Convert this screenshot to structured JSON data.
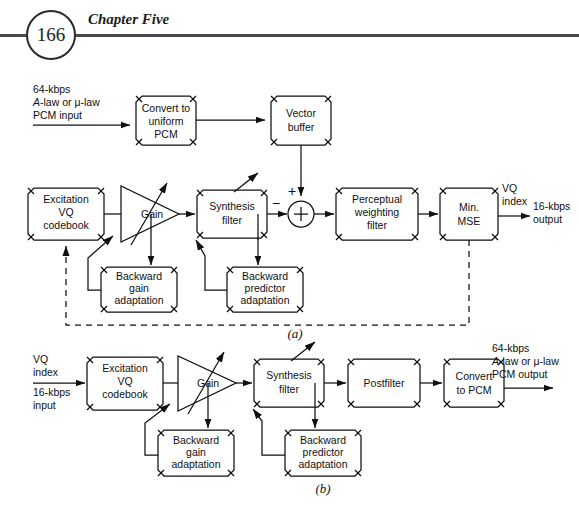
{
  "page": {
    "folio": "166",
    "chapter": "Chapter Five",
    "width": 579,
    "height": 511,
    "background": "#ffffff",
    "ink": "#101012",
    "rule_color": "#4b4b4f"
  },
  "figure": {
    "panels": [
      {
        "id": "a",
        "label": "(a)",
        "role": "encoder"
      },
      {
        "id": "b",
        "label": "(b)",
        "role": "decoder"
      }
    ]
  },
  "panel_a": {
    "label": "(a)",
    "inputs": {
      "pcm_input": {
        "line1": "64-kbps",
        "line2_italic": "A",
        "line2_rest": "-law or μ-law",
        "line3": "PCM input"
      }
    },
    "outputs": {
      "vq_index": "VQ\nindex",
      "vq_index_l1": "VQ",
      "vq_index_l2": "index",
      "bitstream_l1": "16-kbps",
      "bitstream_l2": "output"
    },
    "blocks": [
      {
        "name": "convert-to-uniform-pcm",
        "lines": [
          "Convert to",
          "uniform",
          "PCM"
        ]
      },
      {
        "name": "vector-buffer",
        "lines": [
          "Vector",
          "buffer"
        ]
      },
      {
        "name": "excitation-vq-codebook",
        "lines": [
          "Excitation",
          "VQ",
          "codebook"
        ]
      },
      {
        "name": "gain",
        "lines": [
          "Gain"
        ],
        "shape": "triangle"
      },
      {
        "name": "synthesis-filter",
        "lines": [
          "Synthesis",
          "filter"
        ]
      },
      {
        "name": "summing-junction",
        "lines": [
          "+"
        ],
        "shape": "circle"
      },
      {
        "name": "perceptual-weighting-filter",
        "lines": [
          "Perceptual",
          "weighting",
          "filter"
        ]
      },
      {
        "name": "min-mse",
        "lines": [
          "Min.",
          "MSE"
        ]
      },
      {
        "name": "backward-gain-adaptation",
        "lines": [
          "Backward",
          "gain",
          "adaptation"
        ]
      },
      {
        "name": "backward-predictor-adaptation",
        "lines": [
          "Backward",
          "predictor",
          "adaptation"
        ]
      }
    ],
    "signs": {
      "plus": "+",
      "minus": "−"
    }
  },
  "panel_b": {
    "label": "(b)",
    "inputs": {
      "vq_index_l1": "VQ",
      "vq_index_l2": "index",
      "bitstream_l1": "16-kbps",
      "bitstream_l2": "input"
    },
    "outputs": {
      "pcm_output": {
        "line1": "64-kbps",
        "line2_italic": "A",
        "line2_rest": "-law or μ-law",
        "line3": "PCM output"
      }
    },
    "blocks": [
      {
        "name": "excitation-vq-codebook",
        "lines": [
          "Excitation",
          "VQ",
          "codebook"
        ]
      },
      {
        "name": "gain",
        "lines": [
          "Gain"
        ],
        "shape": "triangle"
      },
      {
        "name": "synthesis-filter",
        "lines": [
          "Synthesis",
          "filter"
        ]
      },
      {
        "name": "postfilter",
        "lines": [
          "Postfilter"
        ]
      },
      {
        "name": "convert-to-pcm",
        "lines": [
          "Convert",
          "to PCM"
        ]
      },
      {
        "name": "backward-gain-adaptation",
        "lines": [
          "Backward",
          "gain",
          "adaptation"
        ]
      },
      {
        "name": "backward-predictor-adaptation",
        "lines": [
          "Backward",
          "predictor",
          "adaptation"
        ]
      }
    ]
  }
}
